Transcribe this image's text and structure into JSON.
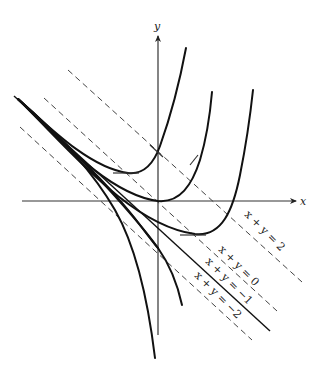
{
  "diagram": {
    "type": "direction field isoclines",
    "axes": {
      "x_label": "x",
      "y_label": "y"
    },
    "isoclines": [
      {
        "label": "x + y = 2",
        "style": "dashed"
      },
      {
        "label": "x + y = 0",
        "style": "dashed"
      },
      {
        "label": "x + y = −1",
        "style": "solid"
      },
      {
        "label": "x + y = −2",
        "style": "dashed"
      }
    ],
    "solution_curve_count": 6
  }
}
